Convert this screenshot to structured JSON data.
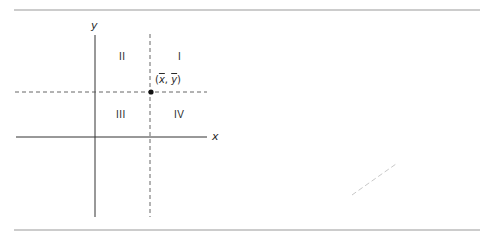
{
  "diagram": {
    "title": "",
    "axes": {
      "x_label": "x",
      "y_label": "y"
    },
    "quadrants": {
      "q1": "I",
      "q2": "II",
      "q3": "III",
      "q4": "IV"
    },
    "mean_point": {
      "open": "(",
      "x": "x",
      "sep": ", ",
      "y": "y",
      "close": ")"
    },
    "colors": {
      "rule": "#9a9a9a",
      "axis": "#333333",
      "dashed": "#555555",
      "point": "#111111",
      "faint_mark": "#c8c8c8"
    }
  }
}
